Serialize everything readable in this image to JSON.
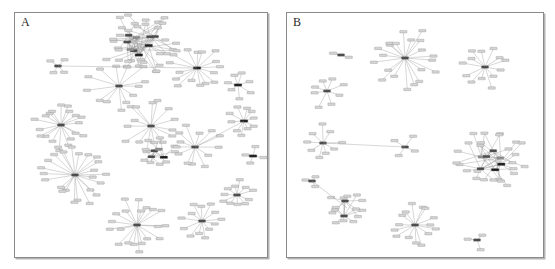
{
  "figure": {
    "type": "two-panel network diagram",
    "background_color": "#ffffff",
    "border_color": "#8a8a8a"
  },
  "panels": [
    {
      "id": "a",
      "label": "A",
      "description": "gene co-expression network panel A"
    },
    {
      "id": "b",
      "label": "B",
      "description": "gene co-expression network panel B"
    }
  ],
  "legend_colors": {
    "leaf_node": "#d5d5d5",
    "hub_node": "#4a4a4a",
    "dark_node": "#1c1c1c",
    "mid_node": "#8e8e8e",
    "edge": "#9a9a9a"
  },
  "chart_data": {
    "type": "network",
    "title": "",
    "xlabel": "",
    "ylabel": "",
    "panels": [
      {
        "label": "A",
        "node_count": 232,
        "cluster_count": 14,
        "clusters": [
          {
            "id": "a-dense-top",
            "kind": "dense-mesh",
            "cx": 125,
            "cy": 30,
            "r": 34,
            "leaves": 34,
            "hubs": 7,
            "dark": 2,
            "edges": "many-to-many"
          },
          {
            "id": "a-hub-topmid",
            "kind": "star",
            "cx": 104,
            "cy": 73,
            "r": 30,
            "leaves": 13,
            "hubs": 1,
            "dark": 0
          },
          {
            "id": "a-small-left",
            "kind": "mini",
            "cx": 43,
            "cy": 53,
            "r": 13,
            "leaves": 4,
            "hubs": 1,
            "dark": 0
          },
          {
            "id": "a-hub-upright",
            "kind": "star",
            "cx": 182,
            "cy": 55,
            "r": 26,
            "leaves": 16,
            "hubs": 1,
            "dark": 1
          },
          {
            "id": "a-small-right",
            "kind": "star",
            "cx": 223,
            "cy": 72,
            "r": 14,
            "leaves": 7,
            "hubs": 0,
            "dark": 1
          },
          {
            "id": "a-hub-left-upper",
            "kind": "star",
            "cx": 46,
            "cy": 112,
            "r": 28,
            "leaves": 19,
            "hubs": 1,
            "dark": 0
          },
          {
            "id": "a-hub-left-lower",
            "kind": "star",
            "cx": 60,
            "cy": 162,
            "r": 32,
            "leaves": 24,
            "hubs": 1,
            "dark": 0
          },
          {
            "id": "a-hub-center",
            "kind": "star",
            "cx": 136,
            "cy": 113,
            "r": 28,
            "leaves": 15,
            "hubs": 1,
            "dark": 0
          },
          {
            "id": "a-mesh-center",
            "kind": "dense-mesh",
            "cx": 143,
            "cy": 140,
            "r": 16,
            "leaves": 9,
            "hubs": 3,
            "dark": 1
          },
          {
            "id": "a-hub-centerright",
            "kind": "star",
            "cx": 180,
            "cy": 134,
            "r": 26,
            "leaves": 13,
            "hubs": 1,
            "dark": 0
          },
          {
            "id": "a-hub-right",
            "kind": "star",
            "cx": 229,
            "cy": 108,
            "r": 16,
            "leaves": 10,
            "hubs": 0,
            "dark": 1
          },
          {
            "id": "a-small-rightmid",
            "kind": "mini",
            "cx": 238,
            "cy": 143,
            "r": 11,
            "leaves": 4,
            "hubs": 0,
            "dark": 1
          },
          {
            "id": "a-hub-rightlow",
            "kind": "star",
            "cx": 222,
            "cy": 182,
            "r": 16,
            "leaves": 11,
            "hubs": 1,
            "dark": 0
          },
          {
            "id": "a-hub-bottomleft",
            "kind": "star",
            "cx": 122,
            "cy": 212,
            "r": 28,
            "leaves": 20,
            "hubs": 1,
            "dark": 0
          },
          {
            "id": "a-hub-bottomright",
            "kind": "star",
            "cx": 187,
            "cy": 208,
            "r": 19,
            "leaves": 13,
            "hubs": 1,
            "dark": 0
          }
        ]
      },
      {
        "label": "B",
        "node_count": 158,
        "cluster_count": 11,
        "clusters": [
          {
            "id": "b-hub-top",
            "kind": "star",
            "cx": 118,
            "cy": 45,
            "r": 32,
            "leaves": 21,
            "hubs": 1,
            "dark": 0
          },
          {
            "id": "b-hub-topright",
            "kind": "star",
            "cx": 198,
            "cy": 54,
            "r": 22,
            "leaves": 13,
            "hubs": 1,
            "dark": 0
          },
          {
            "id": "b-hub-left",
            "kind": "star",
            "cx": 40,
            "cy": 78,
            "r": 18,
            "leaves": 8,
            "hubs": 1,
            "dark": 0
          },
          {
            "id": "b-mini-topleft",
            "kind": "mini",
            "cx": 54,
            "cy": 42,
            "r": 8,
            "leaves": 2,
            "hubs": 0,
            "dark": 0
          },
          {
            "id": "b-hub-leftmid",
            "kind": "star",
            "cx": 36,
            "cy": 130,
            "r": 19,
            "leaves": 9,
            "hubs": 1,
            "dark": 0
          },
          {
            "id": "b-hub-center",
            "kind": "star",
            "cx": 118,
            "cy": 134,
            "r": 17,
            "leaves": 4,
            "hubs": 1,
            "dark": 0
          },
          {
            "id": "b-mesh-right",
            "kind": "dense-mesh",
            "cx": 206,
            "cy": 148,
            "r": 34,
            "leaves": 26,
            "hubs": 5,
            "dark": 2
          },
          {
            "id": "b-mini-leftlow",
            "kind": "mini",
            "cx": 25,
            "cy": 168,
            "r": 9,
            "leaves": 3,
            "hubs": 0,
            "dark": 0
          },
          {
            "id": "b-loop-bottomleft",
            "kind": "loop",
            "cx": 60,
            "cy": 195,
            "r": 20,
            "leaves": 10,
            "hubs": 2,
            "dark": 0
          },
          {
            "id": "b-hub-bottom",
            "kind": "star",
            "cx": 128,
            "cy": 212,
            "r": 24,
            "leaves": 15,
            "hubs": 1,
            "dark": 0
          },
          {
            "id": "b-mini-bottomright",
            "kind": "mini",
            "cx": 190,
            "cy": 227,
            "r": 11,
            "leaves": 3,
            "hubs": 1,
            "dark": 0
          }
        ]
      }
    ]
  }
}
